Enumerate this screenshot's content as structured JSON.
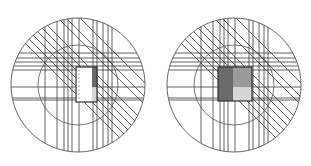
{
  "figure": {
    "description": "Two circular line-arrangement diagrams with a central rectangle",
    "colors": {
      "background": "#ffffff",
      "line": "#3a3a3a",
      "circle": "#555555",
      "dark_fill": "#6a6a6a",
      "mid_fill": "#9a9a9a",
      "light_fill": "#d6d6d6",
      "rect_stroke": "#333333"
    },
    "panels": [
      {
        "id": "left",
        "center": [
          78,
          85
        ],
        "outer_radius": 67,
        "inner_radius": 40,
        "horizontal_lines_y": [
          53,
          58,
          62,
          66,
          70,
          87,
          98,
          100
        ],
        "vertical_lines_x": [
          45,
          57,
          64,
          68,
          72,
          79,
          93,
          97,
          103,
          108,
          112
        ],
        "diagonal_offsets": [
          -62,
          -48,
          -40,
          -22,
          -14,
          -6,
          2,
          10,
          18
        ],
        "rect": {
          "x": 76,
          "y": 67,
          "w": 21,
          "h": 35,
          "fill": "#ffffff"
        },
        "rect_strips": [
          {
            "x": 92,
            "y": 67,
            "w": 5,
            "h": 20,
            "fill": "#6a6a6a"
          },
          {
            "x": 92,
            "y": 87,
            "w": 5,
            "h": 15,
            "fill": "#d6d6d6"
          }
        ],
        "dashed_line": {
          "x": 79,
          "y1": 69,
          "y2": 100
        }
      },
      {
        "id": "right",
        "center": [
          234,
          85
        ],
        "outer_radius": 67,
        "inner_radius": 40,
        "horizontal_lines_y": [
          53,
          58,
          62,
          66,
          70,
          87,
          98,
          100
        ],
        "vertical_lines_x": [
          201,
          213,
          220,
          224,
          228,
          235,
          249,
          253,
          259,
          264,
          268
        ],
        "diagonal_offsets": [
          -218,
          -204,
          -196,
          -178,
          -170,
          -162,
          -154,
          -146,
          -138
        ],
        "rect": {
          "x": 218,
          "y": 67,
          "w": 34,
          "h": 34,
          "fill": "#ffffff"
        },
        "rect_strips": [
          {
            "x": 218,
            "y": 67,
            "w": 15,
            "h": 34,
            "fill": "#6a6a6a"
          },
          {
            "x": 233,
            "y": 67,
            "w": 19,
            "h": 20,
            "fill": "#9a9a9a"
          },
          {
            "x": 233,
            "y": 87,
            "w": 19,
            "h": 14,
            "fill": "#d6d6d6"
          }
        ],
        "dashed_line": null
      }
    ]
  }
}
